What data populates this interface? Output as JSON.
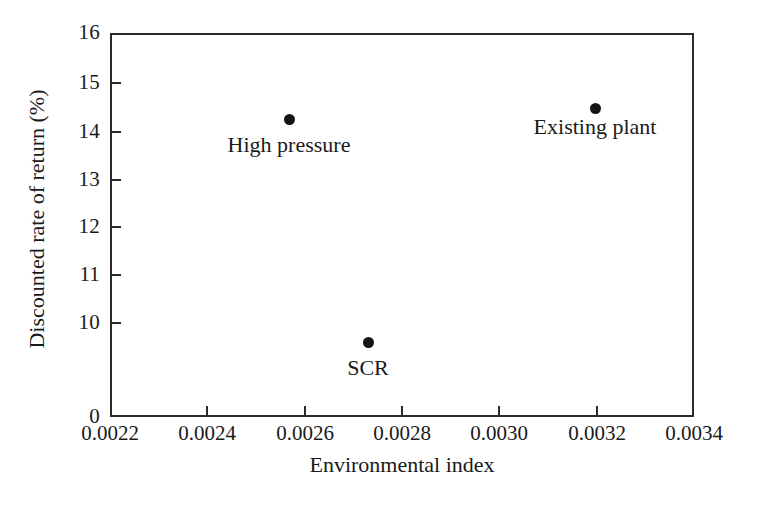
{
  "chart_data": {
    "type": "scatter",
    "title": "",
    "xlabel": "Environmental index",
    "ylabel": "Discounted rate of return (%)",
    "xlim": [
      0.0022,
      0.0034
    ],
    "ylim": [
      0,
      16
    ],
    "y_axis_broken": true,
    "y_break_note": "axis jumps from 0 directly to 10",
    "grid": false,
    "legend": "none",
    "xticks": [
      "0.0022",
      "0.0024",
      "0.0026",
      "0.0028",
      "0.0030",
      "0.0032",
      "0.0034"
    ],
    "xtick_values": [
      0.0022,
      0.0024,
      0.0026,
      0.0028,
      0.003,
      0.0032,
      0.0034
    ],
    "yticks": [
      "0",
      "10",
      "11",
      "12",
      "13",
      "14",
      "15",
      "16"
    ],
    "ytick_values": [
      0,
      10,
      11,
      12,
      13,
      14,
      15,
      16
    ],
    "points": [
      {
        "label": "High pressure",
        "x": 0.00257,
        "y": 14.5,
        "marker": "filled-circle",
        "color": "#141414",
        "label_position": "below"
      },
      {
        "label": "SCR",
        "x": 0.00273,
        "y": 10.55,
        "marker": "filled-circle",
        "color": "#141414",
        "label_position": "below"
      },
      {
        "label": "Existing plant",
        "x": 0.0032,
        "y": 14.7,
        "marker": "filled-circle",
        "color": "#141414",
        "label_position": "below"
      }
    ]
  },
  "axis": {
    "y": {
      "ticks": [
        {
          "label": "16",
          "top": 33
        },
        {
          "label": "15",
          "top": 83
        },
        {
          "label": "14",
          "top": 132
        },
        {
          "label": "13",
          "top": 180
        },
        {
          "label": "12",
          "top": 227
        },
        {
          "label": "11",
          "top": 275
        },
        {
          "label": "10",
          "top": 323
        },
        {
          "label": "0",
          "top": 417
        }
      ]
    },
    "x": {
      "ticks": [
        {
          "label": "0.0022",
          "left": 110
        },
        {
          "label": "0.0024",
          "left": 207
        },
        {
          "label": "0.0026",
          "left": 305
        },
        {
          "label": "0.0028",
          "left": 402
        },
        {
          "label": "0.0030",
          "left": 499
        },
        {
          "label": "0.0032",
          "left": 597
        },
        {
          "label": "0.0034",
          "left": 694
        }
      ]
    }
  },
  "markers": [
    {
      "name": "high-pressure",
      "label": "High pressure",
      "left": 289,
      "top": 119,
      "label_top": 133
    },
    {
      "name": "scr",
      "label": "SCR",
      "left": 368,
      "top": 342,
      "label_top": 356
    },
    {
      "name": "existing-plant",
      "label": "Existing plant",
      "left": 595,
      "top": 108,
      "label_top": 115
    }
  ],
  "style": {
    "axis_color": "#2b2b2b",
    "marker_color": "#141414",
    "background": "#ffffff"
  }
}
